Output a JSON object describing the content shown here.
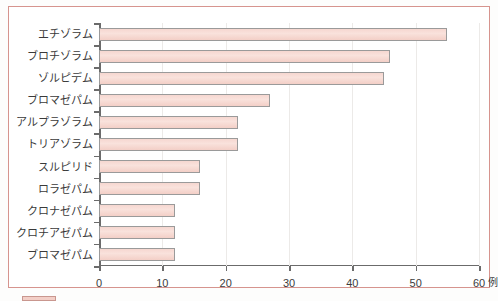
{
  "chart_data": {
    "type": "bar",
    "orientation": "horizontal",
    "title": "",
    "xlabel": "例",
    "ylabel": "",
    "xlim": [
      0,
      60
    ],
    "xticks": [
      0,
      10,
      20,
      30,
      40,
      50,
      60
    ],
    "xtick_labels": [
      "0",
      "10",
      "20",
      "30",
      "40",
      "50",
      "60"
    ],
    "x_unit": "例",
    "grid": true,
    "grid_axis": "x",
    "legend": "none",
    "bar_fill": "#f5d5ce",
    "bar_edge": "#9a9a9a",
    "frame_color": "#d6948e",
    "categories": [
      "エチゾラム",
      "ブロチゾラム",
      "ゾルピデム",
      "ブロマゼパム",
      "アルプラゾラム",
      "トリアゾラム",
      "スルピリド",
      "ロラゼパム",
      "クロナゼパム",
      "クロチアゼパム",
      "ブロマゼパム"
    ],
    "values": [
      55,
      46,
      45,
      27,
      22,
      22,
      16,
      16,
      12,
      12,
      12
    ]
  },
  "caption": {
    "swatch": "legend-swatch",
    "text": ""
  }
}
